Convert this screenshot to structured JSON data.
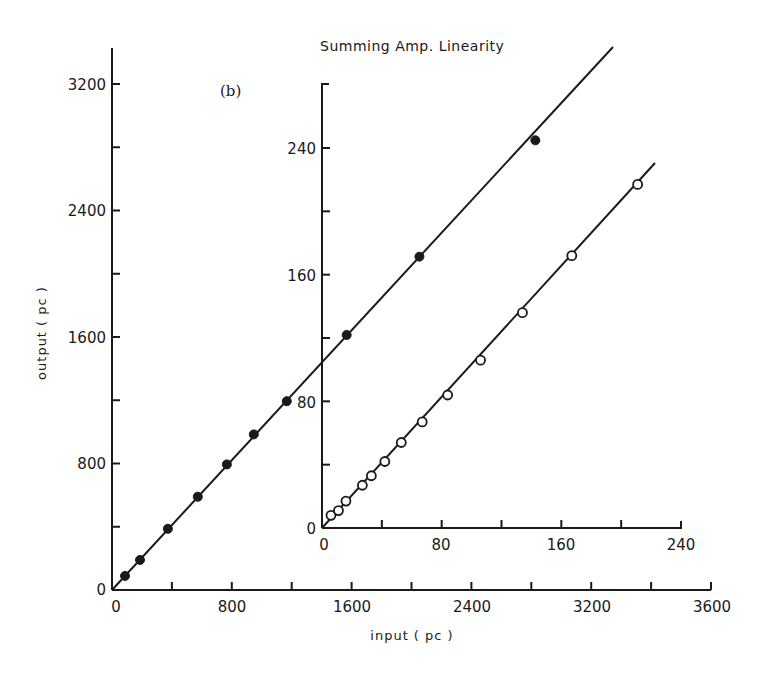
{
  "chart_data": {
    "type": "scatter",
    "title": "Summing Amp. Linearity",
    "panel_label": "(b)",
    "main": {
      "xlabel": "input ( pc )",
      "ylabel": "output ( pc )",
      "x_tick_labels": [
        "0",
        "800",
        "1600",
        "2400",
        "3200",
        "3600"
      ],
      "y_tick_labels": [
        "0",
        "800",
        "1600",
        "2400",
        "3200"
      ],
      "xlim": [
        0,
        4000
      ],
      "ylim": [
        0,
        3200
      ],
      "grid": false,
      "series": [
        {
          "name": "filled",
          "marker": "filled-circle",
          "x": [
            87,
            187,
            373,
            573,
            767,
            947,
            1167,
            1567,
            2053,
            2827
          ],
          "y": [
            89,
            190,
            387,
            590,
            794,
            984,
            1194,
            1613,
            2108,
            2844
          ],
          "fit_line": true
        }
      ]
    },
    "inset": {
      "x_tick_labels": [
        "0",
        "80",
        "160",
        "240"
      ],
      "y_tick_labels": [
        "0",
        "80",
        "160",
        "240"
      ],
      "xlim": [
        0,
        240
      ],
      "ylim": [
        0,
        280
      ],
      "series": [
        {
          "name": "open",
          "marker": "open-circle",
          "x": [
            6,
            11,
            16,
            27,
            33,
            42,
            53,
            67,
            84,
            106,
            134,
            167,
            211
          ],
          "y": [
            8,
            11,
            17,
            27,
            33,
            42,
            54,
            67,
            84,
            106,
            136,
            172,
            217
          ],
          "fit_line": true
        }
      ]
    },
    "colors": {
      "ink": "#1a1a1a",
      "background": "#ffffff"
    }
  }
}
